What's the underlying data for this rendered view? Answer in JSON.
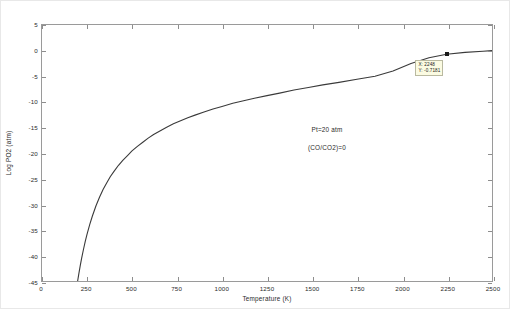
{
  "figure": {
    "background": "#ffffff",
    "axes_color": "#9a9a9a",
    "curve_color": "#3a3a3a"
  },
  "annotations": {
    "pressure_note": "Pt=20 atm",
    "ratio_note": "(CO/CO2)=0",
    "datatip": {
      "x_label": "X: 2248",
      "y_label": "Y: -0.7181",
      "x_value": 2248,
      "y_value": -0.7181
    }
  },
  "chart_data": {
    "type": "line",
    "title": "",
    "xlabel": "Temperature (K)",
    "ylabel": "Log PO2 (atm)",
    "xlim": [
      0,
      2500
    ],
    "ylim": [
      -45,
      5
    ],
    "xticks": [
      0,
      250,
      500,
      750,
      1000,
      1250,
      1500,
      1750,
      2000,
      2250,
      2500
    ],
    "xticklabels": [
      "0",
      "250",
      "500",
      "750",
      "1000",
      "1250",
      "1500",
      "1750",
      "2000",
      "2250",
      "2500"
    ],
    "yticks": [
      5,
      0,
      -5,
      -10,
      -15,
      -20,
      -25,
      -30,
      -35,
      -40,
      -45
    ],
    "yticklabels": [
      "5",
      "0",
      "-5",
      "-10",
      "-15",
      "-20",
      "-25",
      "-30",
      "-35",
      "-40",
      "-45"
    ],
    "grid": false,
    "legend": null,
    "legend_position": "none",
    "series": [
      {
        "name": "Log PO2 vs Temperature",
        "color": "#3a3a3a",
        "x": [
          198,
          205,
          212,
          220,
          230,
          240,
          250,
          265,
          280,
          300,
          320,
          340,
          360,
          380,
          400,
          425,
          450,
          475,
          500,
          530,
          560,
          590,
          620,
          650,
          690,
          730,
          770,
          810,
          850,
          900,
          950,
          1000,
          1060,
          1120,
          1180,
          1250,
          1320,
          1400,
          1480,
          1560,
          1650,
          1750,
          1850,
          1950,
          2050,
          2150,
          2248,
          2350,
          2450,
          2500
        ],
        "y": [
          -45.0,
          -43.5,
          -42.1,
          -40.6,
          -38.9,
          -37.3,
          -35.9,
          -34.0,
          -32.3,
          -30.3,
          -28.6,
          -27.1,
          -25.8,
          -24.6,
          -23.6,
          -22.4,
          -21.4,
          -20.5,
          -19.6,
          -18.7,
          -17.9,
          -17.1,
          -16.4,
          -15.8,
          -15.0,
          -14.3,
          -13.7,
          -13.1,
          -12.6,
          -12.0,
          -11.4,
          -10.9,
          -10.3,
          -9.8,
          -9.3,
          -8.8,
          -8.3,
          -7.7,
          -7.2,
          -6.7,
          -6.2,
          -5.6,
          -5.0,
          -4.0,
          -2.5,
          -1.4,
          -0.72,
          -0.35,
          -0.12,
          0.0
        ]
      }
    ]
  }
}
